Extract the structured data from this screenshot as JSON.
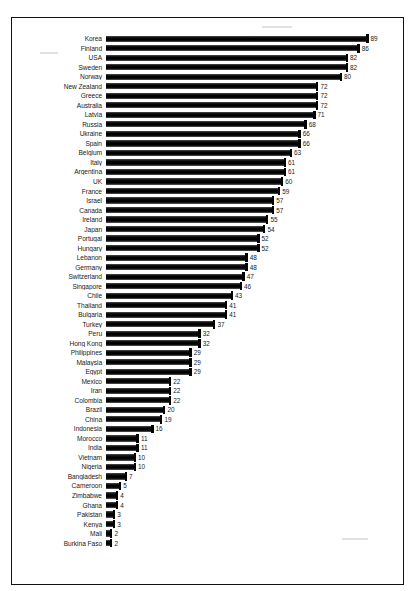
{
  "chart_data": {
    "type": "bar",
    "orientation": "horizontal",
    "title": "",
    "subtitle": "",
    "xlabel": "",
    "ylabel": "",
    "xlim": [
      0,
      89
    ],
    "grid": false,
    "legend": null,
    "data_labels": true,
    "categories": [
      "Korea",
      "Finland",
      "USA",
      "Sweden",
      "Norway",
      "New Zealand",
      "Greece",
      "Australia",
      "Latvia",
      "Russia",
      "Ukraine",
      "Spain",
      "Belgium",
      "Italy",
      "Argentina",
      "UK",
      "France",
      "Israel",
      "Canada",
      "Ireland",
      "Japan",
      "Portugal",
      "Hungary",
      "Lebanon",
      "Germany",
      "Switzerland",
      "Singapore",
      "Chile",
      "Thailand",
      "Bulgaria",
      "Turkey",
      "Peru",
      "Hong Kong",
      "Philippines",
      "Malaysia",
      "Egypt",
      "Mexico",
      "Iran",
      "Colombia",
      "Brazil",
      "China",
      "Indonesia",
      "Morocco",
      "India",
      "Vietnam",
      "Nigeria",
      "Bangladesh",
      "Cameroon",
      "Zimbabwe",
      "Ghana",
      "Pakistan",
      "Kenya",
      "Mali",
      "Burkina Faso"
    ],
    "values": [
      89,
      86,
      82,
      82,
      80,
      72,
      72,
      72,
      71,
      68,
      66,
      66,
      63,
      61,
      61,
      60,
      59,
      57,
      57,
      55,
      54,
      52,
      52,
      48,
      48,
      47,
      46,
      43,
      41,
      41,
      37,
      32,
      32,
      29,
      29,
      29,
      22,
      22,
      22,
      20,
      19,
      16,
      11,
      11,
      10,
      10,
      7,
      5,
      4,
      4,
      3,
      3,
      2,
      2
    ],
    "bar_color": "#000000",
    "background_color": "#ffffff",
    "border_color": "#111111"
  }
}
